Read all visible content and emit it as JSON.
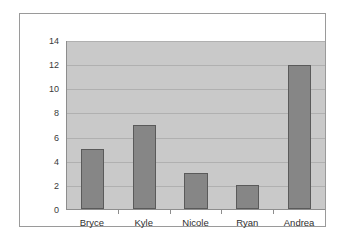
{
  "chart_data": {
    "type": "bar",
    "title": "",
    "subtitle": "",
    "xlabel": "",
    "ylabel": "",
    "categories": [
      "Bryce",
      "Kyle",
      "Nicole",
      "Ryan",
      "Andrea"
    ],
    "values": [
      5,
      7,
      3,
      2,
      12
    ],
    "series": [
      {
        "name": "Series 1",
        "values": [
          5,
          7,
          3,
          2,
          12
        ]
      }
    ],
    "ylim": [
      0,
      14
    ],
    "ytick_labels": [
      "14",
      "12",
      "10",
      "8",
      "6",
      "4",
      "2",
      "0"
    ],
    "ytick_values": [
      14,
      12,
      10,
      8,
      6,
      4,
      2,
      0
    ],
    "ytick_interval": 2,
    "grid": true,
    "grid_axis": "y",
    "legend": false,
    "legend_position": "none",
    "colors": {
      "bar_fill": "#868686",
      "bar_border": "#5a5a5a",
      "plot_background": "#c9c9c9",
      "gridline": "#b0b0b0",
      "axis_line": "#8d8d8d",
      "frame_border": "#9a9a9a",
      "page_background": "#ffffff",
      "tick_label": "#3a3a3a"
    }
  }
}
